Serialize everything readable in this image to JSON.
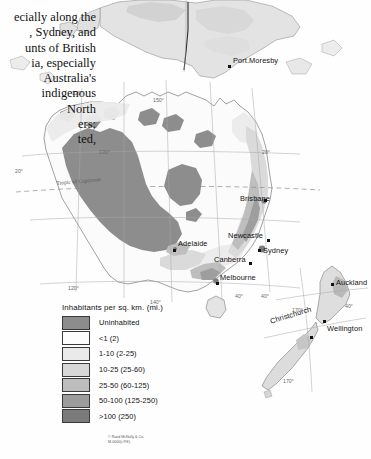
{
  "document": {
    "title": "Population Density — Australia, New Zealand and New Guinea",
    "body_text_lines": [
      "ecially along the",
      ", Sydney, and",
      "unts of British",
      "ia, especially",
      "Australia's",
      "indigenous",
      "North",
      "ers;",
      "ted,"
    ]
  },
  "legend": {
    "title": "Inhabitants per sq. km. (mi.)",
    "items": [
      {
        "label": "Uninhabited",
        "color": "#8d8d8d"
      },
      {
        "label": "<1 (2)",
        "color": "#fdfdfd"
      },
      {
        "label": "1-10 (2-25)",
        "color": "#eaeaea"
      },
      {
        "label": "10-25 (25-60)",
        "color": "#d8d8d8"
      },
      {
        "label": "25-50 (60-125)",
        "color": "#bdbdbd"
      },
      {
        "label": "50-100 (125-250)",
        "color": "#9c9c9c"
      },
      {
        "label": ">100 (250)",
        "color": "#7b7b7b"
      }
    ]
  },
  "credit": {
    "line1": "© Rand McNally & Co.",
    "line2": "M-0000(i-P.E)."
  },
  "map": {
    "cities": [
      {
        "name": "Port.Moresby",
        "x": 233,
        "y": 60,
        "dot_x": 228,
        "dot_y": 67
      },
      {
        "name": "Brisbane",
        "x": 240,
        "y": 198,
        "dot_x": 265,
        "dot_y": 201
      },
      {
        "name": "Newcastle",
        "x": 231,
        "y": 235,
        "dot_x": 268,
        "dot_y": 240
      },
      {
        "name": "Sydney",
        "x": 263,
        "y": 250,
        "dot_x": 259,
        "dot_y": 250
      },
      {
        "name": "Adelaide",
        "x": 180,
        "y": 243,
        "dot_x": 175,
        "dot_y": 250
      },
      {
        "name": "Canberra",
        "x": 216,
        "y": 259,
        "dot_x": 250,
        "dot_y": 263
      },
      {
        "name": "Melbourne",
        "x": 222,
        "y": 277,
        "dot_x": 218,
        "dot_y": 284
      },
      {
        "name": "Auckland",
        "x": 338,
        "y": 282,
        "dot_x": 333,
        "dot_y": 284
      },
      {
        "name": "Wellington",
        "x": 330,
        "y": 328,
        "dot_x": 326,
        "dot_y": 322
      },
      {
        "name": "Christchurch",
        "x": 272,
        "y": 322,
        "dot_x": 311,
        "dot_y": 337
      }
    ],
    "graticule_labels": [
      {
        "text": "120°",
        "x": 72,
        "y": 92
      },
      {
        "text": "20°",
        "x": 15,
        "y": 170
      },
      {
        "text": "130°",
        "x": 99,
        "y": 151
      },
      {
        "text": "150°",
        "x": 153,
        "y": 99
      },
      {
        "text": "20°",
        "x": 262,
        "y": 151
      },
      {
        "text": "120°",
        "x": 68,
        "y": 287
      },
      {
        "text": "140°",
        "x": 150,
        "y": 301
      },
      {
        "text": "40°",
        "x": 235,
        "y": 295
      },
      {
        "text": "170°",
        "x": 292,
        "y": 309
      },
      {
        "text": "40°",
        "x": 345,
        "y": 305
      },
      {
        "text": "40°",
        "x": 261,
        "y": 295
      },
      {
        "text": "170°",
        "x": 283,
        "y": 380
      }
    ],
    "tropic_label": "Tropic of Capricorn"
  },
  "colors": {
    "uninhabited": "#8d8d8d",
    "d_lt1": "#fdfdfd",
    "d_1_10": "#eaeaea",
    "d_10_25": "#d8d8d8",
    "d_25_50": "#bdbdbd",
    "d_50_100": "#9c9c9c",
    "d_gt100": "#7b7b7b",
    "ocean": "#ffffff",
    "coast": "#7a7a7a",
    "graticule": "#9a9a9a"
  }
}
